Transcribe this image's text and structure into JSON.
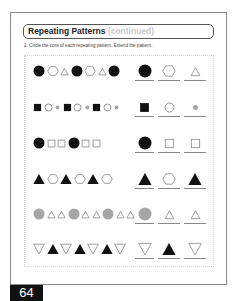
{
  "header": {
    "title": "Repeating Patterns",
    "subtitle": "(continued)"
  },
  "instruction": "2. Circle the core of each repeating pattern. Extend the pattern.",
  "page_number": "64",
  "colors": {
    "black": "#111111",
    "gray": "#a6a6a6",
    "outline": "#888888"
  },
  "rows": [
    {
      "pattern": [
        "black-circle",
        "hexagon-outline",
        "triangle-outline",
        "black-circle",
        "hexagon-outline",
        "triangle-outline",
        "black-circle"
      ],
      "answers": [
        "black-circle",
        "hexagon-outline",
        "triangle-outline"
      ]
    },
    {
      "pattern": [
        "black-square",
        "circle-outline",
        "gray-dot",
        "black-square",
        "circle-outline",
        "gray-dot",
        "black-square",
        "circle-outline",
        "gray-dot"
      ],
      "answers": [
        "black-square",
        "circle-outline",
        "gray-dot"
      ]
    },
    {
      "pattern": [
        "black-circle",
        "square-outline",
        "square-outline",
        "black-circle",
        "square-outline",
        "square-outline"
      ],
      "answers": [
        "black-circle",
        "square-outline",
        "square-outline"
      ]
    },
    {
      "pattern": [
        "black-triangle",
        "hexagon-outline",
        "black-triangle",
        "hexagon-outline",
        "black-triangle",
        "hexagon-outline"
      ],
      "answers": [
        "black-triangle",
        "hexagon-outline",
        "black-triangle"
      ]
    },
    {
      "pattern": [
        "gray-circle",
        "triangle-outline",
        "triangle-outline",
        "gray-circle",
        "triangle-outline",
        "triangle-outline",
        "gray-circle",
        "triangle-outline",
        "triangle-outline"
      ],
      "answers": [
        "gray-circle",
        "triangle-outline",
        "triangle-outline"
      ]
    },
    {
      "pattern": [
        "down-triangle-outline",
        "black-triangle",
        "down-triangle-outline",
        "black-triangle",
        "down-triangle-outline",
        "black-triangle",
        "down-triangle-outline"
      ],
      "answers": [
        "down-triangle-outline",
        "black-triangle",
        "down-triangle-outline"
      ]
    }
  ]
}
